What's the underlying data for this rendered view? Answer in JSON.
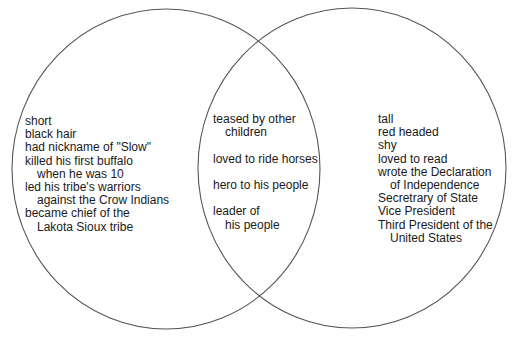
{
  "diagram": {
    "type": "venn",
    "circles": [
      {
        "id": "left",
        "cx": 166,
        "cy": 169,
        "rx": 154,
        "ry": 160,
        "stroke": "#555555"
      },
      {
        "id": "right",
        "cx": 352,
        "cy": 168,
        "rx": 154,
        "ry": 160,
        "stroke": "#555555"
      }
    ],
    "left": {
      "lines": [
        {
          "text": "short",
          "indent": false
        },
        {
          "text": "black hair",
          "indent": false
        },
        {
          "text": "had nickname of \"Slow\"",
          "indent": false
        },
        {
          "text": "killed his first buffalo",
          "indent": false
        },
        {
          "text": "when he was 10",
          "indent": true
        },
        {
          "text": "led his tribe's warriors",
          "indent": false
        },
        {
          "text": "against the Crow Indians",
          "indent": true
        },
        {
          "text": "became chief of the",
          "indent": false
        },
        {
          "text": "Lakota Sioux tribe",
          "indent": true
        }
      ]
    },
    "middle": {
      "lines": [
        {
          "text": "teased by other",
          "indent": false
        },
        {
          "text": "children",
          "indent": true
        },
        {
          "gap": true
        },
        {
          "text": "loved to ride horses",
          "indent": false
        },
        {
          "gap": true
        },
        {
          "text": "hero to his people",
          "indent": false
        },
        {
          "gap": true
        },
        {
          "text": "leader of",
          "indent": false
        },
        {
          "text": "his people",
          "indent": true
        }
      ]
    },
    "right": {
      "lines": [
        {
          "text": "tall",
          "indent": false
        },
        {
          "text": "red headed",
          "indent": false
        },
        {
          "text": "shy",
          "indent": false
        },
        {
          "text": "loved to read",
          "indent": false
        },
        {
          "text": "wrote the Declaration",
          "indent": false
        },
        {
          "text": "of Independence",
          "indent": true
        },
        {
          "text": "Secretrary of State",
          "indent": false
        },
        {
          "text": "Vice President",
          "indent": false
        },
        {
          "text": "Third President of the",
          "indent": false
        },
        {
          "text": "United States",
          "indent": true
        }
      ]
    }
  }
}
